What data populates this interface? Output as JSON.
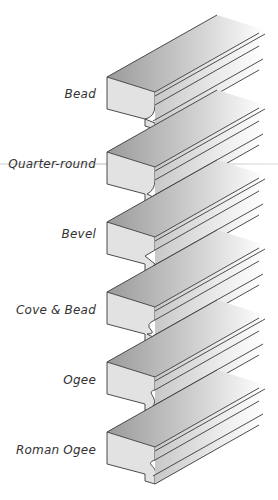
{
  "diagram": {
    "title": "",
    "profiles": [
      {
        "label": "Bead",
        "shape": "bead",
        "top": 65
      },
      {
        "label": "Quarter-round",
        "shape": "quarter-round",
        "top": 140
      },
      {
        "label": "Bevel",
        "shape": "bevel",
        "top": 210
      },
      {
        "label": "Cove & Bead",
        "shape": "cove-bead",
        "top": 280
      },
      {
        "label": "Ogee",
        "shape": "ogee",
        "top": 350
      },
      {
        "label": "Roman Ogee",
        "shape": "roman-ogee",
        "top": 420
      }
    ]
  },
  "colors": {
    "stroke": "#3a3a3a",
    "top_face": "#a8a8a8",
    "front_face": "#e4e4e4",
    "fade": "#ffffff"
  }
}
